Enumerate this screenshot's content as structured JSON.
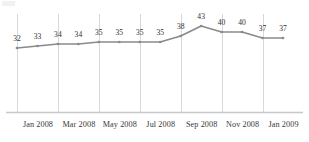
{
  "chart_data": {
    "type": "line",
    "title": "",
    "subtitle": "",
    "xlabel": "",
    "ylabel": "",
    "categories": [
      "Jan 2008",
      "Feb 2008",
      "Mar 2008",
      "Apr 2008",
      "May 2008",
      "Jun 2008",
      "Jul 2008",
      "Aug 2008",
      "Sep 2008",
      "Oct 2008",
      "Nov 2008",
      "Dec 2008",
      "Jan 2009",
      "Feb 2009"
    ],
    "values": [
      32,
      33,
      34,
      34,
      35,
      35,
      35,
      35,
      38,
      43,
      40,
      40,
      37,
      37
    ],
    "data_labels": [
      "32",
      "33",
      "34",
      "34",
      "35",
      "35",
      "35",
      "35",
      "38",
      "43",
      "40",
      "40",
      "37",
      "37"
    ],
    "tick_labels": [
      "Jan 2008",
      "Mar 2008",
      "May 2008",
      "Jul 2008",
      "Sep 2008",
      "Nov 2008",
      "Jan 2009"
    ],
    "tick_indices": [
      0,
      2,
      4,
      6,
      8,
      10,
      12
    ],
    "ylim": [
      0,
      46
    ],
    "grid": "vertical",
    "legend": "none",
    "series_color": "#8a8a8a",
    "marker_color": "#8a8a8a",
    "gridline_color": "#d8d8d8",
    "axis_color": "#c8c8c8",
    "label_color": "#2e2e2e",
    "tick_label_color": "#3a3a3a"
  }
}
